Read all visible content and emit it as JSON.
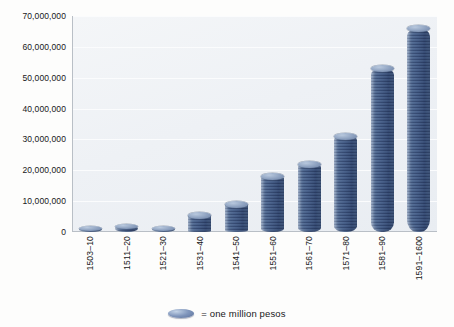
{
  "chart_data": {
    "type": "bar",
    "title": "",
    "subtitle": "",
    "xlabel": "",
    "ylabel": "",
    "categories": [
      "1503–10",
      "1511–20",
      "1521–30",
      "1531–40",
      "1541–50",
      "1551–60",
      "1561–70",
      "1571–80",
      "1581–90",
      "1591–1600"
    ],
    "values": [
      1000000,
      2000000,
      1000000,
      5500000,
      9000000,
      18000000,
      22000000,
      31000000,
      53000000,
      66000000
    ],
    "ylim": [
      0,
      70000000
    ],
    "ytick_values": [
      0,
      10000000,
      20000000,
      30000000,
      40000000,
      50000000,
      60000000,
      70000000
    ],
    "ytick_labels": [
      "0",
      "10,000,000",
      "20,000,000",
      "30,000,000",
      "40,000,000",
      "50,000,000",
      "60,000,000",
      "70,000,000"
    ],
    "grid": true,
    "grid_axis": "y",
    "legend_position": "bottom",
    "legend": [
      {
        "label": "= one million pesos",
        "marker": "coin-ellipse",
        "color": "#7f95bb"
      }
    ],
    "series": [
      {
        "name": "silver imported (pesos)",
        "unit": "pesos",
        "values": [
          1000000,
          2000000,
          1000000,
          5500000,
          9000000,
          18000000,
          22000000,
          31000000,
          53000000,
          66000000
        ]
      }
    ],
    "annotations": []
  },
  "legend": {
    "marker_name": "coin-ellipse",
    "text": "= one million pesos"
  },
  "colors": {
    "coin_light": "#cdd8e6",
    "coin_mid": "#7b90b2",
    "coin_dark": "#62769a",
    "panel_bg": "#eef1f5",
    "axis_line": "#b9bfc6",
    "text": "#17181a"
  }
}
